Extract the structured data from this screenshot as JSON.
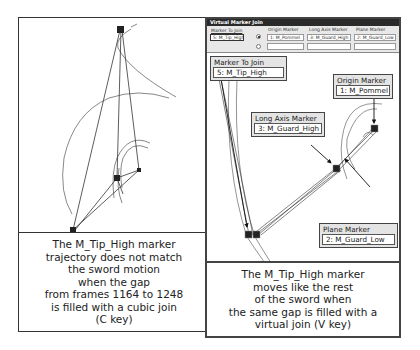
{
  "left_panel": {
    "caption_lines": [
      "The M_Tip_High marker",
      "trajectory does not match",
      "the sword motion",
      "when the gap",
      "from frames 1164 to 1248",
      "is filled with a cubic join",
      "(C key)"
    ]
  },
  "right_panel": {
    "dialog": {
      "title": "Virtual Marker Join",
      "marker_to_join_label": "Marker To Join",
      "marker_to_join_value": "5: M_Tip_High",
      "columns": [
        {
          "label": "Origin Marker",
          "value": "1: M_Pommel"
        },
        {
          "label": "Long Axis Marker",
          "value": "3: M_Guard_High"
        },
        {
          "label": "Plane Marker",
          "value": "2: M_Guard_Low"
        }
      ]
    },
    "callouts": {
      "marker_to_join": {
        "title": "Marker To Join",
        "value": "5: M_Tip_High"
      },
      "origin_marker": {
        "title": "Origin Marker",
        "value": "1: M_Pommel"
      },
      "long_axis_marker": {
        "title": "Long Axis Marker",
        "value": "3: M_Guard_High"
      },
      "plane_marker": {
        "title": "Plane Marker",
        "value": "2: M_Guard_Low"
      }
    },
    "caption_lines": [
      "The M_Tip_High marker",
      "moves like the rest",
      "of the sword when",
      "the same gap is filled with a",
      "virtual join (V key)"
    ]
  }
}
